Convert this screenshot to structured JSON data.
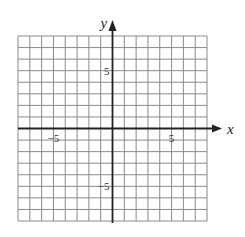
{
  "chart_data": {
    "type": "line",
    "title": "",
    "xlabel": "x",
    "ylabel": "y",
    "xlim": [
      -8,
      8
    ],
    "ylim": [
      -8,
      8
    ],
    "grid": true,
    "grid_step": 1,
    "x_tick_labels": [
      {
        "value": -5,
        "label": "−5"
      },
      {
        "value": 5,
        "label": "5"
      }
    ],
    "y_tick_labels": [
      {
        "value": 5,
        "label": "5"
      },
      {
        "value": -5,
        "label": "−5"
      }
    ],
    "series": [],
    "legend": null,
    "colors": {
      "grid": "#8a8a8a",
      "axis": "#222222",
      "background": "#ffffff"
    }
  },
  "layout": {
    "left": 18,
    "right": 207,
    "top": 36,
    "bottom": 221
  }
}
